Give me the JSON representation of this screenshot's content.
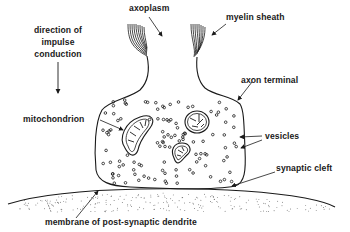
{
  "labels": {
    "axoplasm": "axoplasm",
    "myelin_sheath": "myelin sheath",
    "direction_line1": "direction of",
    "direction_line2": "impulse",
    "direction_line3": "conduction",
    "axon_terminal": "axon terminal",
    "mitochondrion": "mitochondrion",
    "vesicles": "vesicles",
    "synaptic_cleft": "synaptic cleft",
    "membrane": "membrane of post-synaptic dendrite"
  },
  "colors": {
    "ink": "#1a1a1a",
    "background": "#ffffff"
  }
}
